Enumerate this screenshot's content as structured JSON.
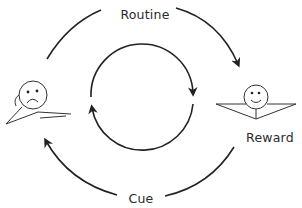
{
  "diagram": {
    "type": "habit-loop",
    "labels": {
      "top": "Routine",
      "right": "Reward",
      "bottom": "Cue"
    },
    "figures": {
      "left": "sad-stick-figure",
      "right": "happy-stick-figure"
    },
    "colors": {
      "stroke": "#222222",
      "text": "#2b2b2b",
      "background": "#ffffff"
    }
  }
}
